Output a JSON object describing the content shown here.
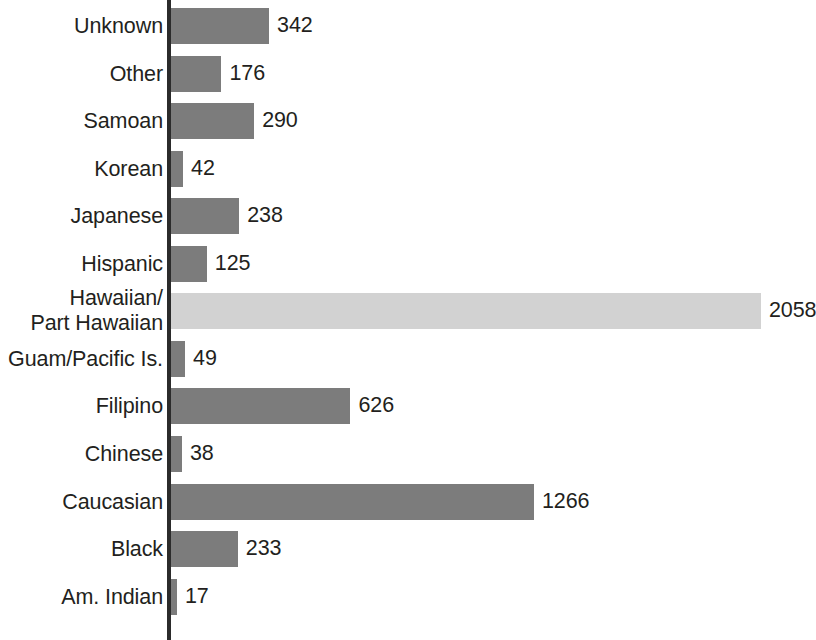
{
  "chart_data": {
    "type": "bar",
    "orientation": "horizontal",
    "title": "",
    "subtitle": "",
    "xlabel": "",
    "ylabel": "",
    "grid": false,
    "legend": false,
    "axis_visible": {
      "category_axis": true,
      "value_axis": false
    },
    "value_labels_shown": true,
    "xlim": [
      0,
      2058
    ],
    "categories": [
      "Unknown",
      "Other",
      "Samoan",
      "Korean",
      "Japanese",
      "Hispanic",
      "Hawaiian/\nPart Hawaiian",
      "Guam/Pacific Is.",
      "Filipino",
      "Chinese",
      "Caucasian",
      "Black",
      "Am. Indian"
    ],
    "values": [
      342,
      176,
      290,
      42,
      238,
      125,
      2058,
      49,
      626,
      38,
      1266,
      233,
      17
    ],
    "value_labels": [
      "342",
      "176",
      "290",
      "42",
      "238",
      "125",
      "2058",
      "49",
      "626",
      "38",
      "1266",
      "233",
      "17"
    ],
    "highlight_index": 6,
    "colors": {
      "bar": "#7c7c7c",
      "bar_highlight": "#d2d2d2",
      "axis": "#2b2b2b",
      "text": "#231f20",
      "background": "#ffffff"
    }
  }
}
